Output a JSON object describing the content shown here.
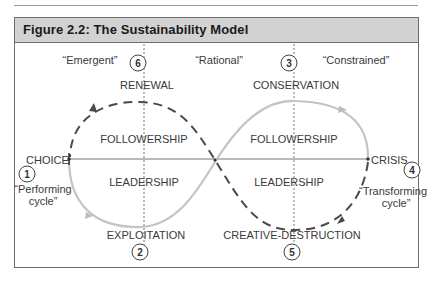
{
  "figure": {
    "title": "Figure 2.2: The Sustainability Model"
  },
  "columns": {
    "left": "“Emergent”",
    "center": "“Rational”",
    "right": "“Constrained”"
  },
  "stages": [
    {
      "number": "1",
      "label": "CHOICE"
    },
    {
      "number": "2",
      "label": "EXPLOITATION"
    },
    {
      "number": "3",
      "label": "CONSERVATION"
    },
    {
      "number": "4",
      "label": "CRISIS"
    },
    {
      "number": "5",
      "label": "CREATIVE-DESTRUCTION"
    },
    {
      "number": "6",
      "label": "RENEWAL"
    }
  ],
  "quadrants": {
    "left_top": "FOLLOWERSHIP",
    "left_bottom": "LEADERSHIP",
    "right_top": "FOLLOWERSHIP",
    "right_bottom": "LEADERSHIP"
  },
  "cycles": {
    "performing": {
      "line1": "“Performing",
      "line2": "cycle”",
      "style": "solid",
      "color": "#c4c4c4"
    },
    "transforming": {
      "line1": "“Transforming",
      "line2": "cycle”",
      "style": "dashed",
      "color": "#4a4a4a"
    }
  },
  "colors": {
    "header_bg": "#d2d2d2",
    "frame": "#6d6d6d",
    "solid_curve": "#c4c4c4",
    "dashed_curve": "#4a4a4a",
    "axis": "#777777"
  }
}
